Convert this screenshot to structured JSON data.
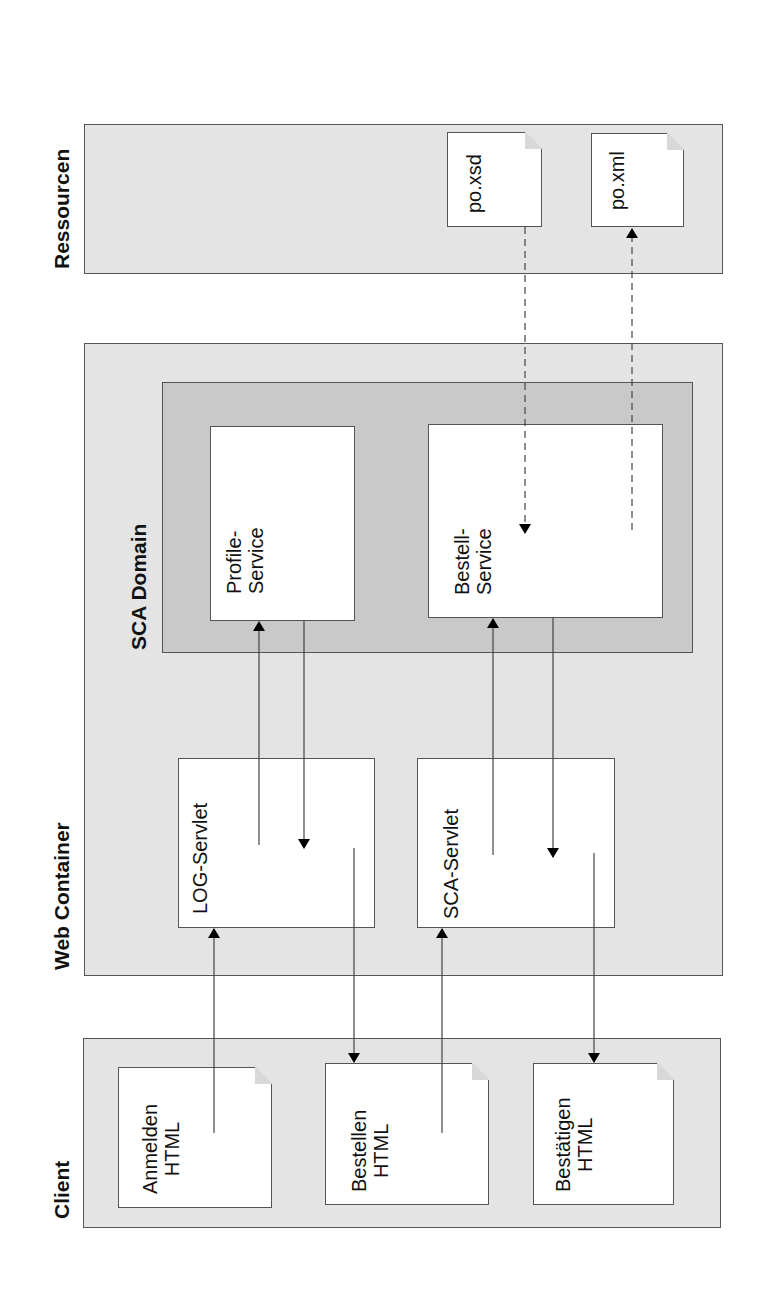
{
  "diagram": {
    "orientation": "rotated -90deg",
    "colors": {
      "zone_fill": "#e4e4e4",
      "domain_fill": "#c9c9c9",
      "node_fill": "#ffffff",
      "stroke": "#555555"
    },
    "zones": {
      "resources": {
        "label": "Ressourcen"
      },
      "web_container": {
        "label": "Web Container"
      },
      "sca_domain": {
        "label": "SCA Domain"
      },
      "client": {
        "label": "Client"
      }
    },
    "resources": {
      "po_xsd": "po.xsd",
      "po_xml": "po.xml"
    },
    "sca_domain": {
      "profile_service": {
        "line1": "Profile-",
        "line2": "Service"
      },
      "bestell_service": {
        "line1": "Bestell-",
        "line2": "Service"
      }
    },
    "web_container": {
      "log_servlet": "LOG-Servlet",
      "sca_servlet": "SCA-Servlet"
    },
    "client": {
      "anmelden": {
        "line1": "Anmelden",
        "line2": "HTML"
      },
      "bestellen": {
        "line1": "Bestellen",
        "line2": "HTML"
      },
      "bestaetigen": {
        "line1": "Bestätigen",
        "line2": "HTML"
      }
    },
    "connections": [
      {
        "from": "Anmelden HTML",
        "to": "LOG-Servlet",
        "style": "solid"
      },
      {
        "from": "LOG-Servlet",
        "to": "Bestellen HTML",
        "style": "solid"
      },
      {
        "from": "Bestellen HTML",
        "to": "SCA-Servlet",
        "style": "solid"
      },
      {
        "from": "SCA-Servlet",
        "to": "Bestätigen HTML",
        "style": "solid"
      },
      {
        "from": "LOG-Servlet",
        "to": "Profile-Service",
        "style": "solid"
      },
      {
        "from": "Profile-Service",
        "to": "LOG-Servlet",
        "style": "solid"
      },
      {
        "from": "SCA-Servlet",
        "to": "Bestell-Service",
        "style": "solid"
      },
      {
        "from": "Bestell-Service",
        "to": "SCA-Servlet",
        "style": "solid"
      },
      {
        "from": "po.xsd",
        "to": "Bestell-Service",
        "style": "dashed"
      },
      {
        "from": "Bestell-Service",
        "to": "po.xml",
        "style": "dashed"
      }
    ]
  }
}
